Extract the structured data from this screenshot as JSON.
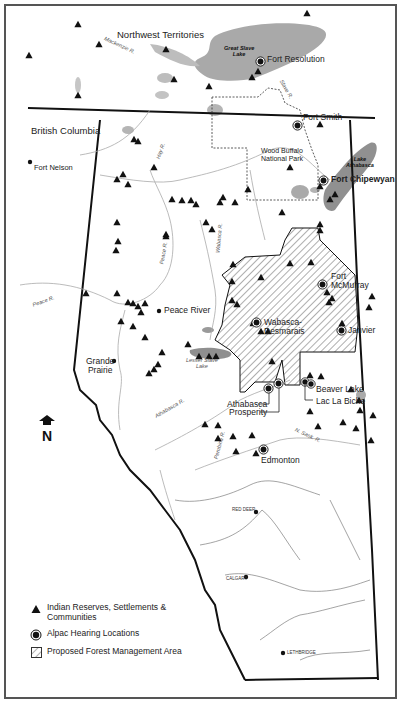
{
  "map": {
    "title_regions": {
      "northwest_territories": "Northwest Territories",
      "british_columbia": "British Columbia"
    },
    "park": {
      "name_line1": "Wood Buffalo",
      "name_line2": "National Park"
    },
    "lakes": [
      {
        "name_line1": "Great Slave",
        "name_line2": "Lake"
      },
      {
        "name_line1": "Lake",
        "name_line2": "Athabasca"
      },
      {
        "name_line1": "Lesser Slave",
        "name_line2": "Lake"
      }
    ],
    "rivers": {
      "mackenzie": "Mackenzie R.",
      "slave": "Slave R.",
      "hay": "Hay R.",
      "peace_north": "Peace R.",
      "peace_west": "Peace R.",
      "wabasca": "Wabasca R.",
      "athabasca": "Athabasca R.",
      "pembina": "Pembina R.",
      "n_sask": "N. Sask. R."
    },
    "hearing_locations": [
      {
        "name": "Fort Resolution"
      },
      {
        "name": "Fort Smith"
      },
      {
        "name": "Fort Chipewyan"
      },
      {
        "name": "Fort McMurray"
      },
      {
        "name": "Wabasca-Desmarais"
      },
      {
        "name": "Janvier"
      },
      {
        "name": "Athabasca"
      },
      {
        "name": "Prosperity"
      },
      {
        "name": "Beaver Lake"
      },
      {
        "name": "Lac La Biche"
      },
      {
        "name": "Edmonton"
      }
    ],
    "towns": [
      {
        "name": "Fort Nelson"
      },
      {
        "name": "Peace River"
      },
      {
        "name_line1": "Grande",
        "name_line2": "Prairie"
      },
      {
        "name": "RED DEER"
      },
      {
        "name": "CALGARY"
      },
      {
        "name": "LETHBRIDGE"
      }
    ],
    "north_arrow": "N"
  },
  "legend": {
    "items": [
      {
        "symbol": "triangle-icon",
        "label": "Indian Reserves, Settlements & Communities"
      },
      {
        "symbol": "hearing-location-icon",
        "label": "Alpac Hearing Locations"
      },
      {
        "symbol": "hatched-area-icon",
        "label": "Proposed Forest Management Area"
      }
    ]
  },
  "colors": {
    "water": "#9a9a9a",
    "border": "#111111",
    "river": "#aaaaaa",
    "frame": "#555555"
  }
}
